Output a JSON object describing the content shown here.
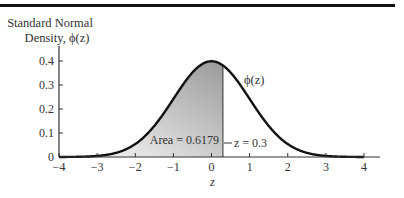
{
  "chart_data": {
    "type": "area",
    "title": "",
    "ylabel_line1": "Standard Normal",
    "ylabel_line2": "Density, ϕ(z)",
    "xlabel": "z",
    "curve_label": "ϕ(z)",
    "function": "standard_normal_pdf",
    "xlim": [
      -4,
      4
    ],
    "ylim": [
      0,
      0.4
    ],
    "x_ticks": [
      -4,
      -3,
      -2,
      -1,
      0,
      1,
      2,
      3,
      4
    ],
    "x_tick_labels": [
      "−4",
      "−3",
      "−2",
      "−1",
      "0",
      "1",
      "2",
      "3",
      "4"
    ],
    "y_ticks": [
      0,
      0.1,
      0.2,
      0.3,
      0.4
    ],
    "y_tick_labels": [
      "0",
      "0.1",
      "0.2",
      "0.3",
      "0.4"
    ],
    "shaded_region": {
      "from": -4,
      "to": 0.3,
      "area": 0.6179
    },
    "annotations": {
      "area_label": "Area = 0.6179",
      "cutoff_label": "z = 0.3",
      "cutoff_value": 0.3
    },
    "grid": false,
    "colors": {
      "curve": "#111111",
      "axis": "#333333",
      "shade_dark": "#9a9a9a",
      "shade_light": "#ffffff"
    }
  }
}
